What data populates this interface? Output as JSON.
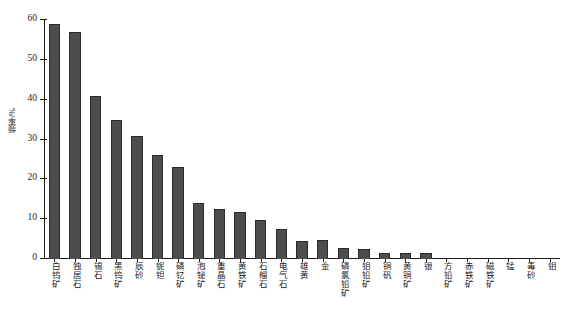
{
  "chart_data": {
    "type": "bar",
    "title": "",
    "subtitle": "",
    "xlabel": "",
    "ylabel": "频率/%",
    "ylim": [
      0,
      60
    ],
    "yticks": [
      0,
      10,
      20,
      30,
      40,
      50,
      60
    ],
    "ytick_labels": [
      "0",
      "10",
      "20",
      "30",
      "40",
      "50",
      "60"
    ],
    "grid": false,
    "legend": null,
    "bar_color": "#4d4d4d",
    "bar_edge_color": "#2b2b2b",
    "axis_color": "#1a1a1a",
    "background": "#ffffff",
    "categories": [
      "白钨矿",
      "独居石",
      "锡石",
      "黑钨矿",
      "辰砂",
      "铌钽",
      "磷钇矿",
      "泡铋矿",
      "重晶石",
      "黄铁矿",
      "石榴石",
      "电气石",
      "雄黄",
      "金",
      "磷氯铅矿",
      "钼铅矿",
      "铜矾",
      "黄铜矿",
      "银",
      "方铅矿",
      "赤铁矿",
      "磁铁矿",
      "锰",
      "毒砂",
      "钼"
    ],
    "values": [
      59,
      57,
      41,
      35,
      31,
      26,
      23,
      14,
      12.5,
      11.8,
      9.8,
      7.6,
      4.5,
      4.7,
      2.8,
      2.6,
      1.5,
      1.6,
      1.5,
      0,
      0,
      0,
      0,
      0,
      0
    ]
  }
}
